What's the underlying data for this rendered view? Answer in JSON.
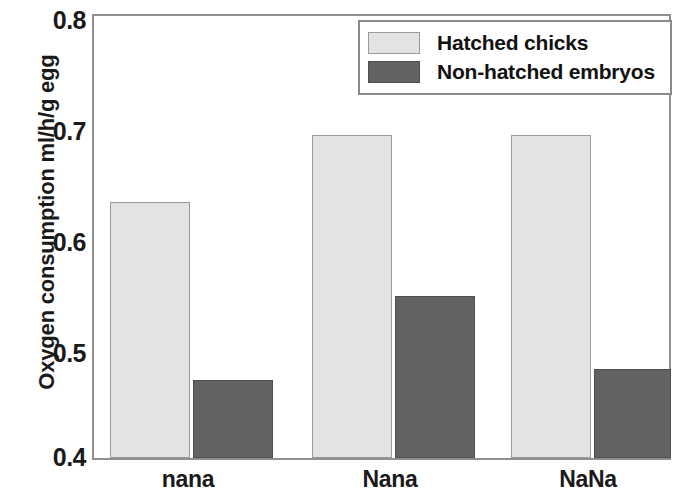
{
  "chart_data": {
    "type": "bar",
    "title": "",
    "xlabel": "",
    "ylabel": "Oxygen consumption ml/h/g egg",
    "ylim": [
      0.4,
      0.8
    ],
    "yticks": [
      "0.4",
      "0.5",
      "0.6",
      "0.7",
      "0.8"
    ],
    "grid": false,
    "legend_position": "top-right",
    "categories": [
      "nana",
      "Nana",
      "NaNa"
    ],
    "series": [
      {
        "name": "Hatched chicks",
        "color": "#e3e3e3",
        "values": [
          0.63,
          0.69,
          0.69
        ]
      },
      {
        "name": "Non-hatched embryos",
        "color": "#626262",
        "values": [
          0.47,
          0.545,
          0.48
        ]
      }
    ]
  },
  "axes": {
    "y_title": "Oxygen consumption ml/h/g egg",
    "y_tick_labels": [
      "0.8",
      "0.7",
      "0.6",
      "0.5",
      "0.4"
    ],
    "x_tick_labels": [
      "nana",
      "Nana",
      "NaNa"
    ]
  },
  "legend": {
    "entries": [
      {
        "label": "Hatched chicks",
        "swatch": "light-gray-swatch"
      },
      {
        "label": "Non-hatched embryos",
        "swatch": "dark-gray-swatch"
      }
    ]
  }
}
